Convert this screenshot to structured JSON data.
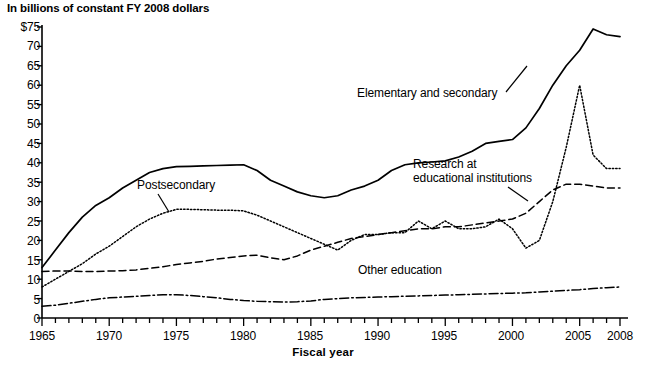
{
  "chart_data": {
    "type": "line",
    "title": "In billions of constant FY 2008 dollars",
    "xlabel": "Fiscal year",
    "ylabel": "",
    "xlim": [
      1965,
      2008
    ],
    "ylim": [
      0,
      75
    ],
    "grid": false,
    "legend_position": "inline-annotations",
    "y_ticks": [
      0,
      5,
      10,
      15,
      20,
      25,
      30,
      35,
      40,
      45,
      50,
      55,
      60,
      65,
      70,
      75
    ],
    "y_tick_labels": [
      "0",
      "5",
      "10",
      "15",
      "20",
      "25",
      "30",
      "35",
      "40",
      "45",
      "50",
      "55",
      "60",
      "65",
      "70",
      "$75"
    ],
    "x_ticks": [
      1965,
      1970,
      1975,
      1980,
      1985,
      1990,
      1995,
      2000,
      2005,
      2008
    ],
    "x_tick_labels": [
      "1965",
      "1970",
      "1975",
      "1980",
      "1985",
      "1990",
      "1995",
      "2000",
      "2005",
      "2008"
    ],
    "x_minor_tick_interval": 1,
    "x": [
      1965,
      1966,
      1967,
      1968,
      1969,
      1970,
      1971,
      1972,
      1973,
      1974,
      1975,
      1976,
      1977,
      1978,
      1979,
      1980,
      1981,
      1982,
      1983,
      1984,
      1985,
      1986,
      1987,
      1988,
      1989,
      1990,
      1991,
      1992,
      1993,
      1994,
      1995,
      1996,
      1997,
      1998,
      1999,
      2000,
      2001,
      2002,
      2003,
      2004,
      2005,
      2006,
      2007,
      2008
    ],
    "series": [
      {
        "name": "Elementary and secondary",
        "line_style": "solid",
        "values": [
          13.0,
          17.5,
          22.0,
          26.0,
          29.0,
          31.0,
          33.5,
          35.5,
          37.5,
          38.5,
          39.0,
          39.1,
          39.2,
          39.3,
          39.4,
          39.5,
          38.0,
          35.5,
          34.0,
          32.5,
          31.5,
          31.0,
          31.5,
          33.0,
          34.0,
          35.5,
          38.0,
          39.5,
          40.0,
          40.2,
          40.5,
          41.5,
          43.0,
          45.0,
          45.5,
          46.0,
          49.0,
          54.0,
          60.0,
          65.0,
          69.0,
          74.5,
          73.0,
          72.5
        ]
      },
      {
        "name": "Postsecondary",
        "line_style": "dotted",
        "values": [
          8.0,
          10.0,
          12.0,
          14.0,
          16.5,
          18.5,
          21.0,
          23.5,
          25.5,
          27.0,
          28.0,
          28.0,
          27.9,
          27.8,
          27.8,
          27.6,
          26.5,
          25.0,
          23.5,
          22.0,
          20.5,
          19.0,
          17.5,
          20.0,
          21.5,
          21.5,
          22.0,
          22.0,
          25.0,
          23.0,
          25.0,
          23.0,
          23.0,
          23.5,
          25.5,
          23.0,
          18.0,
          20.0,
          30.0,
          44.0,
          60.0,
          42.0,
          38.5,
          38.5
        ]
      },
      {
        "name": "Research at educational institutions",
        "line_style": "dashed",
        "values": [
          12.0,
          12.1,
          12.1,
          12.0,
          12.0,
          12.1,
          12.2,
          12.4,
          12.8,
          13.2,
          13.8,
          14.2,
          14.6,
          15.2,
          15.6,
          16.0,
          16.2,
          15.5,
          15.0,
          16.0,
          17.5,
          18.5,
          19.5,
          20.5,
          21.0,
          21.5,
          22.0,
          22.5,
          23.0,
          23.0,
          23.5,
          23.5,
          24.0,
          24.5,
          25.0,
          25.5,
          27.0,
          30.0,
          33.0,
          34.5,
          34.5,
          34.0,
          33.5,
          33.5
        ]
      },
      {
        "name": "Other education",
        "line_style": "dash-dot",
        "values": [
          3.0,
          3.3,
          3.8,
          4.3,
          4.8,
          5.2,
          5.4,
          5.6,
          5.8,
          6.0,
          6.0,
          5.8,
          5.5,
          5.2,
          4.8,
          4.5,
          4.3,
          4.2,
          4.1,
          4.2,
          4.4,
          4.8,
          5.0,
          5.2,
          5.3,
          5.4,
          5.5,
          5.6,
          5.7,
          5.8,
          5.9,
          6.0,
          6.1,
          6.2,
          6.3,
          6.4,
          6.5,
          6.7,
          6.9,
          7.1,
          7.3,
          7.6,
          7.8,
          8.0
        ]
      }
    ],
    "annotations": [
      {
        "text": "Elementary and secondary",
        "series": "Elementary and secondary"
      },
      {
        "text": "Postsecondary",
        "series": "Postsecondary"
      },
      {
        "text": "Research at",
        "series": "Research at educational institutions"
      },
      {
        "text": "educational institutions",
        "series": "Research at educational institutions"
      },
      {
        "text": "Other education",
        "series": "Other education"
      }
    ]
  },
  "labels": {
    "elementary_secondary": "Elementary and secondary",
    "postsecondary": "Postsecondary",
    "research_line1": "Research at",
    "research_line2": "educational institutions",
    "other_education": "Other education"
  },
  "axis": {
    "y_labels": [
      "$75",
      "70",
      "65",
      "60",
      "55",
      "50",
      "45",
      "40",
      "35",
      "30",
      "25",
      "20",
      "15",
      "10",
      "5",
      "0"
    ],
    "x_labels": [
      "1965",
      "1970",
      "1975",
      "1980",
      "1985",
      "1990",
      "1995",
      "2000",
      "2005",
      "2008"
    ]
  },
  "colors": {
    "line": "#000000",
    "background": "#ffffff",
    "text": "#000000"
  }
}
